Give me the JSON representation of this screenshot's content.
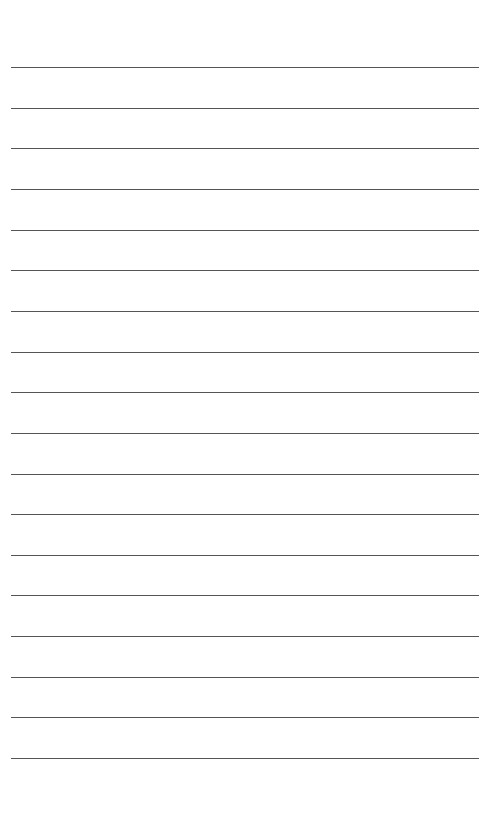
{
  "page": {
    "type": "lined-paper",
    "background_color": "#ffffff",
    "line_color": "#555555",
    "line_count": 18,
    "first_line_y": 67,
    "line_spacing": 40.65,
    "line_left": 11,
    "line_width": 468
  }
}
